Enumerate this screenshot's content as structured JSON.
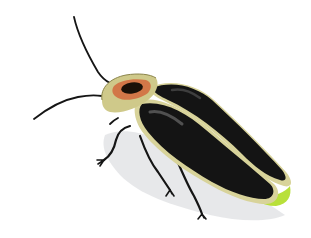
{
  "image": {
    "subject": "firefly",
    "description": "Illustration of a firefly beetle on a white background, viewed from above at an angle",
    "colors": {
      "background": "#ffffff",
      "elytra": "#141414",
      "elytra_highlight": "#5a5a5a",
      "elytra_edge": "#d8d39a",
      "pronotum": "#cfc98a",
      "pronotum_spot": "#d2683c",
      "pronotum_dark": "#1a1108",
      "legs": "#151515",
      "antennae": "#151515",
      "glow": "#b8e03a",
      "shadow": "#dfe1e3"
    }
  }
}
